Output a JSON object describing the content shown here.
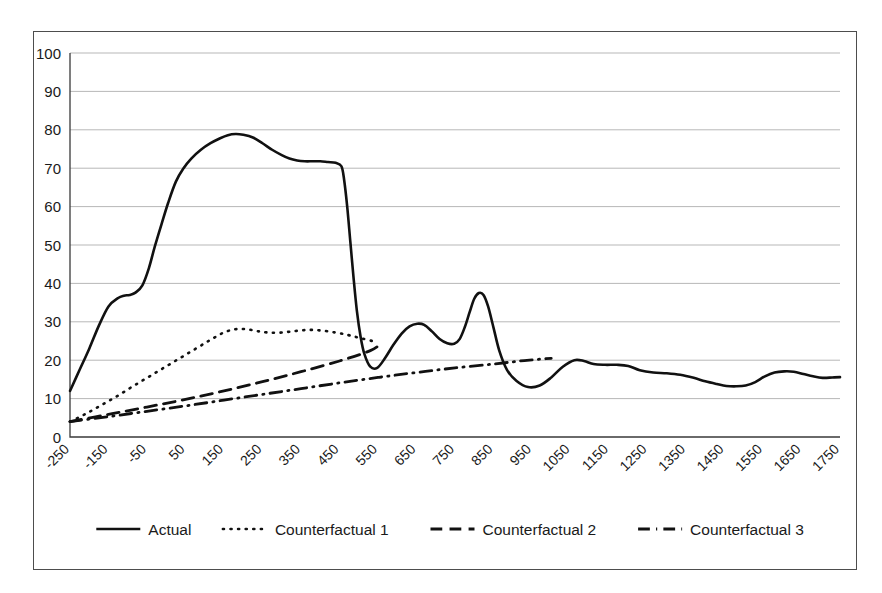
{
  "chart_data": {
    "type": "line",
    "title": "",
    "xlabel": "",
    "ylabel": "",
    "xlim": [
      -250,
      1750
    ],
    "ylim": [
      0,
      100
    ],
    "grid": true,
    "legend_position": "bottom",
    "ytick_labels": [
      "0",
      "10",
      "20",
      "30",
      "40",
      "50",
      "60",
      "70",
      "80",
      "90",
      "100"
    ],
    "yticks": [
      0,
      10,
      20,
      30,
      40,
      50,
      60,
      70,
      80,
      90,
      100
    ],
    "xtick_labels": [
      "-250",
      "-150",
      "-50",
      "50",
      "150",
      "250",
      "350",
      "450",
      "550",
      "650",
      "750",
      "850",
      "950",
      "1050",
      "1150",
      "1250",
      "1350",
      "1450",
      "1550",
      "1650",
      "1750"
    ],
    "xticks": [
      -250,
      -150,
      -50,
      50,
      150,
      250,
      350,
      450,
      550,
      650,
      750,
      850,
      950,
      1050,
      1150,
      1250,
      1350,
      1450,
      1550,
      1650,
      1750
    ],
    "series": [
      {
        "name": "Actual",
        "style": "solid",
        "color": "#111111",
        "width": 2.6,
        "x": [
          -250,
          -225,
          -200,
          -175,
          -150,
          -125,
          -110,
          -95,
          -80,
          -62,
          -45,
          -30,
          -12,
          5,
          25,
          45,
          65,
          90,
          115,
          140,
          160,
          180,
          200,
          225,
          250,
          275,
          300,
          320,
          340,
          360,
          380,
          400,
          420,
          440,
          455,
          462,
          470,
          478,
          486,
          495,
          505,
          515,
          530,
          548,
          568,
          590,
          612,
          632,
          652,
          670,
          690,
          710,
          730,
          748,
          762,
          775,
          788,
          800,
          812,
          824,
          836,
          850,
          865,
          885,
          910,
          940,
          970,
          1000,
          1030,
          1060,
          1085,
          1110,
          1140,
          1170,
          1200,
          1230,
          1265,
          1300,
          1335,
          1370,
          1400,
          1430,
          1455,
          1480,
          1505,
          1530,
          1555,
          1580,
          1605,
          1630,
          1655,
          1680,
          1705,
          1730,
          1750
        ],
        "y": [
          12.0,
          17.5,
          23.0,
          29.0,
          34.0,
          36.2,
          36.8,
          37.0,
          37.6,
          39.5,
          44.0,
          49.5,
          55.5,
          61.0,
          66.5,
          70.0,
          72.5,
          74.8,
          76.5,
          77.8,
          78.6,
          78.9,
          78.7,
          78.0,
          76.5,
          74.8,
          73.4,
          72.5,
          72.0,
          71.8,
          71.8,
          71.8,
          71.6,
          71.4,
          70.5,
          67.0,
          60.0,
          51.0,
          42.0,
          33.0,
          26.0,
          21.5,
          18.3,
          18.0,
          20.5,
          24.0,
          27.0,
          28.8,
          29.5,
          29.2,
          27.5,
          25.5,
          24.4,
          24.3,
          25.5,
          28.5,
          32.5,
          36.0,
          37.5,
          37.0,
          34.0,
          28.5,
          22.5,
          17.5,
          14.6,
          13.0,
          13.4,
          15.5,
          18.3,
          20.0,
          19.8,
          19.0,
          18.8,
          18.8,
          18.5,
          17.4,
          16.8,
          16.6,
          16.2,
          15.4,
          14.5,
          13.8,
          13.3,
          13.2,
          13.4,
          14.3,
          15.8,
          16.8,
          17.1,
          17.0,
          16.4,
          15.8,
          15.4,
          15.5,
          15.6
        ]
      },
      {
        "name": "Counterfactual 1",
        "style": "dotted",
        "color": "#111111",
        "width": 2.6,
        "x": [
          -250,
          -210,
          -170,
          -130,
          -90,
          -50,
          -10,
          30,
          70,
          110,
          145,
          175,
          205,
          235,
          265,
          300,
          335,
          370,
          405,
          440,
          470,
          495,
          515,
          535
        ],
        "y": [
          4.0,
          6.0,
          8.2,
          10.5,
          13.0,
          15.4,
          17.8,
          20.2,
          22.6,
          25.0,
          27.0,
          28.0,
          28.1,
          27.6,
          27.2,
          27.2,
          27.6,
          27.9,
          27.7,
          27.2,
          26.6,
          26.0,
          25.5,
          25.0
        ]
      },
      {
        "name": "Counterfactual 2",
        "style": "dashed",
        "color": "#111111",
        "width": 2.8,
        "x": [
          -250,
          -150,
          -50,
          50,
          150,
          250,
          350,
          450,
          530,
          560
        ],
        "y": [
          4.0,
          5.9,
          7.8,
          9.8,
          12.0,
          14.4,
          17.0,
          19.8,
          22.5,
          24.5
        ]
      },
      {
        "name": "Counterfactual 3",
        "style": "dashdot",
        "color": "#111111",
        "width": 2.8,
        "x": [
          -250,
          -150,
          -50,
          50,
          150,
          250,
          350,
          450,
          550,
          650,
          750,
          850,
          930,
          1000
        ],
        "y": [
          4.0,
          5.3,
          6.7,
          8.1,
          9.6,
          11.1,
          12.6,
          14.1,
          15.5,
          16.8,
          18.0,
          19.0,
          19.9,
          20.5
        ]
      }
    ],
    "legend": [
      {
        "label": "Actual",
        "style": "solid"
      },
      {
        "label": "Counterfactual 1",
        "style": "dotted"
      },
      {
        "label": "Counterfactual 2",
        "style": "dashed"
      },
      {
        "label": "Counterfactual 3",
        "style": "dashdot"
      }
    ]
  }
}
